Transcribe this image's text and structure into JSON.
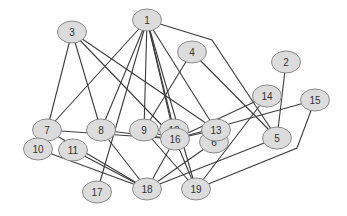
{
  "diagram": {
    "type": "undirected-graph",
    "colors": {
      "node_fill": "#dcdcdc",
      "node_stroke": "#8a8a8a",
      "edge": "#3c3c3c",
      "label": "#333333",
      "background": "#ffffff"
    },
    "nodes": [
      {
        "id": "1",
        "label": "1",
        "x": 147,
        "y": 20
      },
      {
        "id": "2",
        "label": "2",
        "x": 286,
        "y": 62
      },
      {
        "id": "3",
        "label": "3",
        "x": 72,
        "y": 32
      },
      {
        "id": "4",
        "label": "4",
        "x": 192,
        "y": 52
      },
      {
        "id": "5",
        "label": "5",
        "x": 277,
        "y": 138
      },
      {
        "id": "6",
        "label": "6",
        "x": 214,
        "y": 142
      },
      {
        "id": "7",
        "label": "7",
        "x": 47,
        "y": 130
      },
      {
        "id": "8",
        "label": "8",
        "x": 101,
        "y": 130
      },
      {
        "id": "9",
        "label": "9",
        "x": 144,
        "y": 130
      },
      {
        "id": "10",
        "label": "10",
        "x": 38,
        "y": 149
      },
      {
        "id": "11",
        "label": "11",
        "x": 73,
        "y": 150
      },
      {
        "id": "12",
        "label": "12",
        "x": 174,
        "y": 130
      },
      {
        "id": "13",
        "label": "13",
        "x": 216,
        "y": 130
      },
      {
        "id": "14",
        "label": "14",
        "x": 267,
        "y": 96
      },
      {
        "id": "15",
        "label": "15",
        "x": 315,
        "y": 100
      },
      {
        "id": "16",
        "label": "16",
        "x": 175,
        "y": 139
      },
      {
        "id": "17",
        "label": "17",
        "x": 97,
        "y": 192
      },
      {
        "id": "18",
        "label": "18",
        "x": 147,
        "y": 189
      },
      {
        "id": "19",
        "label": "19",
        "x": 196,
        "y": 189
      }
    ],
    "edges": [
      {
        "from": "1",
        "to": "7"
      },
      {
        "from": "1",
        "to": "8"
      },
      {
        "from": "1",
        "to": "17"
      },
      {
        "from": "1",
        "to": "9"
      },
      {
        "from": "1",
        "to": "16"
      },
      {
        "from": "1",
        "to": "12"
      },
      {
        "from": "1",
        "to": "19"
      },
      {
        "from": "1",
        "to": "13"
      },
      {
        "from": "1",
        "to": "5",
        "via": [
          [
            212,
            40
          ]
        ]
      },
      {
        "from": "3",
        "to": "7"
      },
      {
        "from": "3",
        "to": "8"
      },
      {
        "from": "3",
        "to": "13"
      },
      {
        "from": "3",
        "to": "16"
      },
      {
        "from": "4",
        "to": "9"
      },
      {
        "from": "4",
        "to": "5"
      },
      {
        "from": "2",
        "to": "5"
      },
      {
        "from": "14",
        "to": "16"
      },
      {
        "from": "14",
        "to": "19"
      },
      {
        "from": "15",
        "to": "16"
      },
      {
        "from": "15",
        "to": "19",
        "via": [
          [
            297,
            148
          ]
        ]
      },
      {
        "from": "7",
        "to": "16"
      },
      {
        "from": "7",
        "to": "18"
      },
      {
        "from": "8",
        "to": "18"
      },
      {
        "from": "8",
        "to": "16"
      },
      {
        "from": "9",
        "to": "16"
      },
      {
        "from": "9",
        "to": "19"
      },
      {
        "from": "12",
        "to": "16"
      },
      {
        "from": "13",
        "to": "16"
      },
      {
        "from": "10",
        "to": "18"
      },
      {
        "from": "11",
        "to": "18"
      },
      {
        "from": "16",
        "to": "18"
      },
      {
        "from": "16",
        "to": "19"
      },
      {
        "from": "6",
        "to": "18"
      },
      {
        "from": "5",
        "to": "18"
      }
    ],
    "node_rx": 14.5,
    "node_ry": 11
  }
}
